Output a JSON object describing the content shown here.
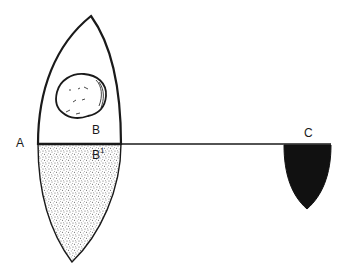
{
  "diagram": {
    "type": "float-in-liquid illustration",
    "colors": {
      "stroke": "#1a1a1a",
      "background": "#ffffff",
      "stipple": "#5a5a5a",
      "solid_fill": "#111111"
    },
    "labels": {
      "A": "A",
      "B": "B",
      "B1_base": "B",
      "B1_sup": "1",
      "C": "C"
    },
    "shapes": [
      {
        "id": "vessel-upper",
        "description": "pointed arch outline above waterline"
      },
      {
        "id": "vessel-lower",
        "description": "stippled submerged pointed section below waterline"
      },
      {
        "id": "object-B",
        "description": "irregular rounded blob inside upper vessel"
      },
      {
        "id": "waterline",
        "description": "horizontal line from A through to C"
      },
      {
        "id": "object-C",
        "description": "solid black shield shape hanging below line at right"
      }
    ]
  }
}
